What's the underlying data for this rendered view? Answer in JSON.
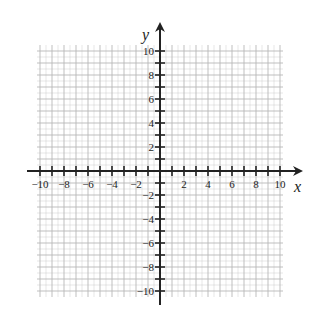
{
  "chart_data": {
    "type": "coordinate-grid",
    "title": "",
    "xlabel": "x",
    "ylabel": "y",
    "xlim": [
      -10,
      10
    ],
    "ylim": [
      -10,
      10
    ],
    "grid": true,
    "grid_minor_step": 0.5,
    "grid_major_step": 1,
    "x_tick_labels": [
      "-10",
      "-8",
      "-6",
      "-4",
      "-2",
      "2",
      "4",
      "6",
      "8",
      "10"
    ],
    "y_tick_labels": [
      "10",
      "8",
      "6",
      "4",
      "2",
      "-2",
      "-4",
      "-6",
      "-8",
      "-10"
    ],
    "x_tick_values": [
      -10,
      -8,
      -6,
      -4,
      -2,
      2,
      4,
      6,
      8,
      10
    ],
    "y_tick_values": [
      10,
      8,
      6,
      4,
      2,
      -2,
      -4,
      -6,
      -8,
      -10
    ],
    "series": [],
    "colors": {
      "grid": "#b8b8b8",
      "axis": "#222222",
      "background": "#ffffff"
    }
  },
  "labels": {
    "x_axis": "x",
    "y_axis": "y"
  }
}
